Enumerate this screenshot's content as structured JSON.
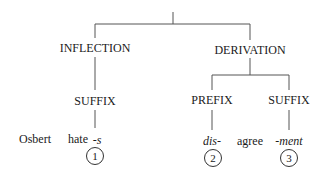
{
  "tree": {
    "level1": {
      "left": "INFLECTION",
      "right": "DERIVATION"
    },
    "level2": {
      "inflection_child": "SUFFIX",
      "derivation_left": "PREFIX",
      "derivation_right": "SUFFIX"
    },
    "words": {
      "subject": "Osbert",
      "verb": "hate",
      "inflection_suffix": "-s",
      "prefix": "dis-",
      "stem": "agree",
      "derivation_suffix": "-ment"
    },
    "markers": [
      "1",
      "2",
      "3"
    ]
  },
  "colors": {
    "line": "#555555",
    "text": "#1a1a1a"
  }
}
